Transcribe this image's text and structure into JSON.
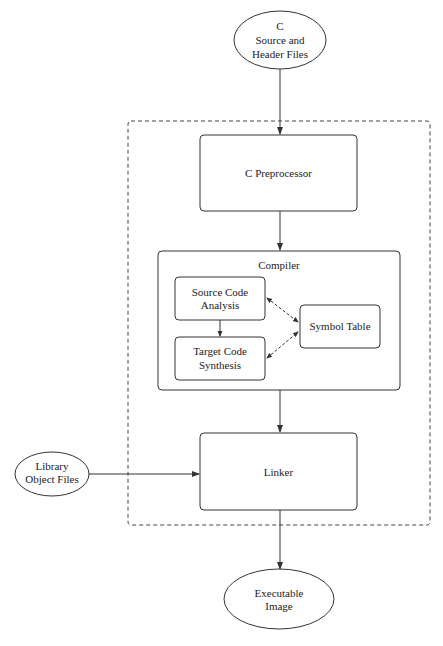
{
  "diagram": {
    "nodes": {
      "source_files": {
        "lines": [
          "C",
          "Source and",
          "Header Files"
        ],
        "shape": "ellipse"
      },
      "preprocessor": {
        "label": "C Preprocessor",
        "shape": "rounded-rect"
      },
      "compiler": {
        "label": "Compiler",
        "shape": "rounded-rect-container"
      },
      "source_analysis": {
        "lines": [
          "Source Code",
          "Analysis"
        ],
        "shape": "rounded-rect"
      },
      "target_synthesis": {
        "lines": [
          "Target Code",
          "Synthesis"
        ],
        "shape": "rounded-rect"
      },
      "symbol_table": {
        "label": "Symbol Table",
        "shape": "rounded-rect"
      },
      "linker": {
        "label": "Linker",
        "shape": "rounded-rect"
      },
      "library_files": {
        "lines": [
          "Library",
          "Object Files"
        ],
        "shape": "ellipse"
      },
      "executable": {
        "lines": [
          "Executable",
          "Image"
        ],
        "shape": "ellipse"
      }
    },
    "edges": [
      {
        "from": "source_files",
        "to": "preprocessor",
        "style": "solid"
      },
      {
        "from": "preprocessor",
        "to": "compiler",
        "style": "solid"
      },
      {
        "from": "source_analysis",
        "to": "target_synthesis",
        "style": "solid"
      },
      {
        "from": "source_analysis",
        "to": "symbol_table",
        "style": "dashed",
        "bidirectional": true
      },
      {
        "from": "target_synthesis",
        "to": "symbol_table",
        "style": "dashed",
        "bidirectional": true
      },
      {
        "from": "compiler",
        "to": "linker",
        "style": "solid"
      },
      {
        "from": "library_files",
        "to": "linker",
        "style": "solid"
      },
      {
        "from": "linker",
        "to": "executable",
        "style": "solid"
      }
    ],
    "boundary": {
      "style": "dashed",
      "contains": [
        "preprocessor",
        "compiler",
        "linker"
      ]
    },
    "colors": {
      "stroke": "#333333",
      "text": "#222222",
      "background": "#ffffff"
    }
  }
}
